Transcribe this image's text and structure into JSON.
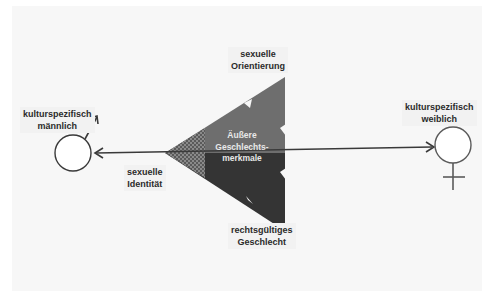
{
  "diagram": {
    "center_label": "Äußere Geschlechts-merkmale",
    "center_label_lines": [
      "Äußere",
      "Geschlechts-",
      "merkmale"
    ],
    "top_label": [
      "sexuelle",
      "Orientierung"
    ],
    "bottom_label": [
      "rechtsgültiges",
      "Geschlecht"
    ],
    "left_axis_label": [
      "sexuelle",
      "Identität"
    ],
    "male_label": [
      "kulturspezifisch",
      "männlich"
    ],
    "female_label": [
      "kulturspezifisch",
      "weiblich"
    ],
    "symbols": {
      "left": "male-symbol",
      "right": "female-symbol"
    },
    "colors": {
      "upper_triangle": "#6e6e6e",
      "lower_triangle": "#343434",
      "hatch": "#4a4a4a",
      "line": "#3a3a3a",
      "background_panel": "#f7f7f7"
    }
  }
}
